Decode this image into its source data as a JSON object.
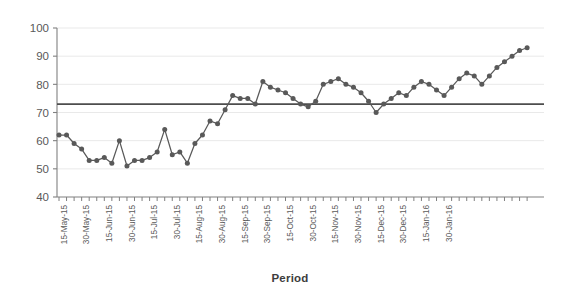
{
  "chart_data": {
    "type": "line",
    "title": "",
    "xlabel": "Period",
    "ylabel": "",
    "ylim": [
      40,
      100
    ],
    "ytick_values": [
      40,
      50,
      60,
      70,
      80,
      90,
      100
    ],
    "grid": true,
    "legend": "none",
    "line_color": "#595959",
    "marker_color": "#595959",
    "reference_line": {
      "label": "",
      "value": 73,
      "color": "#4d4d4d"
    },
    "xtick_labels": [
      "15-May-15",
      "30-May-15",
      "15-Jun-15",
      "30-Jun-15",
      "15-Jul-15",
      "30-Jul-15",
      "15-Aug-15",
      "30-Aug-15",
      "15-Sep-15",
      "30-Sep-15",
      "15-Oct-15",
      "30-Oct-15",
      "15-Nov-15",
      "30-Nov-15",
      "15-Dec-15",
      "30-Dec-15",
      "15-Jan-16",
      "30-Jan-16"
    ],
    "xtick_label_interval": 3,
    "series": [
      {
        "name": "Measurement",
        "values": [
          62,
          62,
          59,
          57,
          53,
          53,
          54,
          52,
          60,
          51,
          53,
          53,
          54,
          56,
          64,
          55,
          56,
          52,
          59,
          62,
          67,
          66,
          71,
          76,
          75,
          75,
          73,
          81,
          79,
          78,
          77,
          75,
          73,
          72,
          74,
          80,
          81,
          82,
          80,
          79,
          77,
          74,
          70,
          73,
          75,
          77,
          76,
          79,
          81,
          80,
          78,
          76,
          79,
          82,
          84,
          83,
          80,
          83,
          86,
          88,
          90,
          92,
          93
        ]
      }
    ]
  },
  "axis_titles": {
    "x": "Period"
  }
}
